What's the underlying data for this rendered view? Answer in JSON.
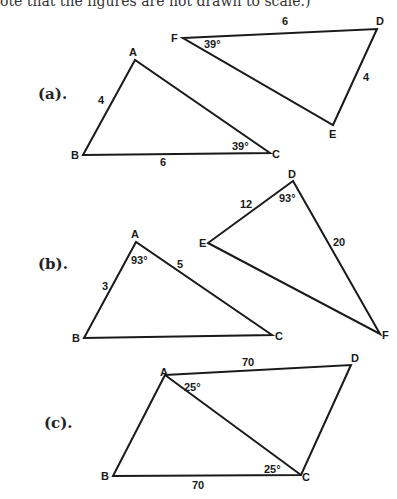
{
  "header": {
    "text": "ote that the figures are not drawn to scale.)"
  },
  "parts": [
    {
      "label": "(a).",
      "triangles": [
        {
          "vertices": {
            "A": [
              135,
              60
            ],
            "B": [
              83,
              155
            ],
            "C": [
              270,
              153
            ]
          },
          "labels": {
            "A": "A",
            "B": "B",
            "C": "C"
          },
          "side_labels": {
            "AB": "4",
            "BC": "6"
          },
          "angle_labels": {
            "C": "39°"
          }
        },
        {
          "vertices": {
            "F": [
              183,
              38
            ],
            "D": [
              377,
              29
            ],
            "E": [
              333,
              125
            ]
          },
          "labels": {
            "F": "F",
            "D": "D",
            "E": "E"
          },
          "side_labels": {
            "FD": "6",
            "DE": "4"
          },
          "angle_labels": {
            "F": "39°"
          }
        }
      ]
    },
    {
      "label": "(b).",
      "triangles": [
        {
          "vertices": {
            "A": [
              136,
              242
            ],
            "B": [
              84,
              338
            ],
            "C": [
              272,
              335
            ]
          },
          "labels": {
            "A": "A",
            "B": "B",
            "C": "C"
          },
          "side_labels": {
            "AB": "3",
            "AC": "5"
          },
          "angle_labels": {
            "A": "93°"
          }
        },
        {
          "vertices": {
            "D": [
              293,
              181
            ],
            "E": [
              208,
              243
            ],
            "F": [
              380,
              334
            ]
          },
          "labels": {
            "D": "D",
            "E": "E",
            "F": "F"
          },
          "side_labels": {
            "DE": "12",
            "DF": "20"
          },
          "angle_labels": {
            "D": "93°"
          }
        }
      ]
    },
    {
      "label": "(c).",
      "quadrilateral": {
        "vertices": {
          "A": [
            165,
            375
          ],
          "B": [
            113,
            476
          ],
          "C": [
            301,
            475
          ],
          "D": [
            351,
            365
          ]
        },
        "labels": {
          "A": "A",
          "B": "B",
          "C": "C",
          "D": "D"
        },
        "side_labels": {
          "AD": "70",
          "BC": "70"
        },
        "angle_labels": {
          "A": "25°",
          "C": "25°"
        }
      }
    }
  ]
}
